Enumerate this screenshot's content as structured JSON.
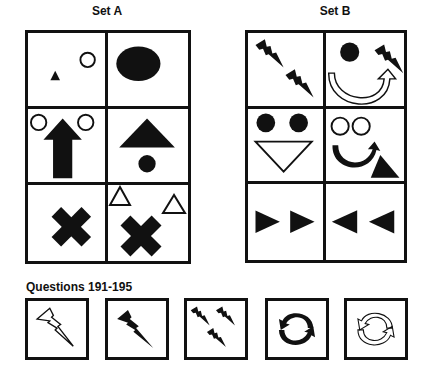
{
  "set_a": {
    "title": "Set A",
    "cells": [
      {
        "row": 1,
        "col": 1,
        "content": "small black triangle, small outline circle upper right"
      },
      {
        "row": 1,
        "col": 2,
        "content": "large black oval"
      },
      {
        "row": 2,
        "col": 1,
        "content": "two outline circles flanking a black up arrow"
      },
      {
        "row": 2,
        "col": 2,
        "content": "large black triangle above small black circle"
      },
      {
        "row": 3,
        "col": 1,
        "content": "black X"
      },
      {
        "row": 3,
        "col": 2,
        "content": "two outline triangles above a black X"
      }
    ]
  },
  "set_b": {
    "title": "Set B",
    "cells": [
      {
        "row": 1,
        "col": 1,
        "content": "two black lightning bolts diagonally"
      },
      {
        "row": 1,
        "col": 2,
        "content": "black circle, black lightning bolt, outline curved arrow"
      },
      {
        "row": 2,
        "col": 1,
        "content": "two black circles above outline down triangle"
      },
      {
        "row": 2,
        "col": 2,
        "content": "two outline circles, black curved arrow, black triangle"
      },
      {
        "row": 3,
        "col": 1,
        "content": "two black right-pointing triangles"
      },
      {
        "row": 3,
        "col": 2,
        "content": "two black left-pointing triangles"
      }
    ]
  },
  "questions": {
    "label": "Questions 191-195",
    "items": [
      {
        "number": 191,
        "content": "outline lightning bolt"
      },
      {
        "number": 192,
        "content": "black lightning bolt"
      },
      {
        "number": 193,
        "content": "three black lightning bolts"
      },
      {
        "number": 194,
        "content": "black circular arrows"
      },
      {
        "number": 195,
        "content": "outline circular arrows"
      }
    ]
  },
  "colors": {
    "ink": "#111111",
    "background": "#ffffff"
  }
}
